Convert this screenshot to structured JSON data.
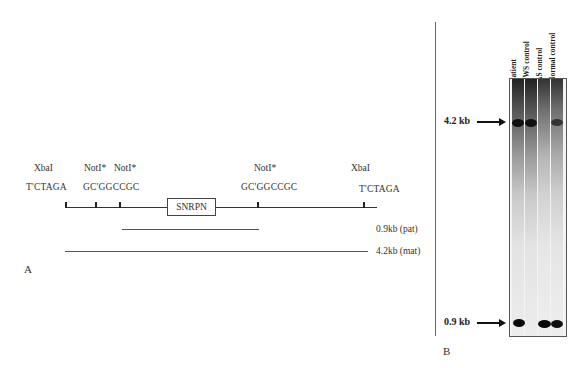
{
  "panel_a": {
    "label": "A",
    "sites": [
      {
        "enzyme": "XbaI",
        "sequence": "T'CTAGA"
      },
      {
        "enzyme": "NotI*",
        "sequence": "GC'GGCCGC"
      },
      {
        "enzyme": "NotI*",
        "sequence": ""
      },
      {
        "enzyme": "NotI*",
        "sequence": "GC'GGCCGC"
      },
      {
        "enzyme": "XbaI",
        "sequence": "T'CTAGA"
      }
    ],
    "gene_box": "SNRPN",
    "fragments": [
      {
        "label": "0.9kb (pat)"
      },
      {
        "label": "4.2kb (mat)"
      }
    ]
  },
  "panel_b": {
    "label": "B",
    "lanes": [
      "Patient",
      "PWS control",
      "AS control",
      "Normal control"
    ],
    "markers": [
      {
        "label": "4.2 kb"
      },
      {
        "label": "0.9 kb"
      }
    ],
    "bands": {
      "4.2 kb": {
        "Patient": "strong",
        "PWS control": "strong",
        "AS control": "absent",
        "Normal control": "moderate"
      },
      "0.9 kb": {
        "Patient": "strong",
        "PWS control": "absent",
        "AS control": "strong",
        "Normal control": "strong"
      }
    }
  }
}
